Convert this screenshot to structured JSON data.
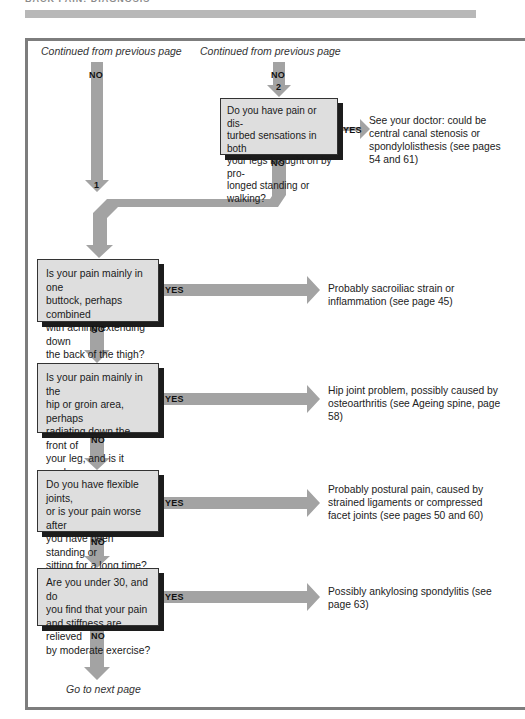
{
  "header": {
    "title": "BACK PAIN: DIAGNOSIS"
  },
  "continuation": {
    "left": "Continued from previous page",
    "right": "Continued from previous page",
    "bottom": "Go to next page"
  },
  "labels": {
    "yes": "YES",
    "no": "NO",
    "connector_1": "1",
    "connector_2": "2"
  },
  "colors": {
    "arrow": "#a3a3a3",
    "box_fill": "#dedede",
    "box_shadow": "#1c1c1c",
    "frame": "#7d7d7d",
    "header_bar": "#b8b8b8"
  },
  "questions": [
    {
      "text": "Do you have pain or dis-turbed sensations in both your legs brought on by pro-longed standing or walking?",
      "lines": [
        "Do you have pain or dis-",
        "turbed sensations in both",
        "your legs brought on by pro-",
        "longed standing or walking?"
      ],
      "yes_result": "See your doctor: could be central canal stenosis or spondylolisthesis (see pages 54 and 61)"
    },
    {
      "lines": [
        "Is your pain mainly in one",
        "buttock, perhaps combined",
        "with aching extending down",
        "the back of the thigh?"
      ],
      "yes_result": "Probably sacroiliac strain or inflammation (see page 45)"
    },
    {
      "lines": [
        "Is your pain mainly in the",
        "hip or groin area, perhaps",
        "radiating down the front of",
        "your leg, and is it made",
        "worse when you walk?"
      ],
      "yes_result": "Hip joint problem, possibly caused by osteoarthritis (see Ageing spine, page 58)"
    },
    {
      "lines": [
        "Do you have flexible joints,",
        "or is your pain worse after",
        "you have been standing or",
        "sitting for a long time?"
      ],
      "yes_result": "Probably postural pain, caused by strained ligaments or compressed facet joints (see pages 50 and 60)"
    },
    {
      "lines": [
        "Are you under 30, and do",
        "you find that your pain",
        "and stiffness are relieved",
        "by moderate exercise?"
      ],
      "yes_result": "Possibly ankylosing spondylitis (see page 63)"
    }
  ]
}
